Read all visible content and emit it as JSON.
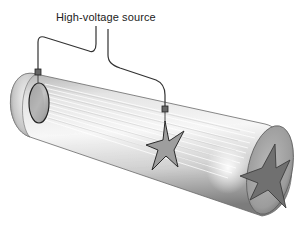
{
  "diagram": {
    "title": "High-voltage source",
    "components": {
      "source_label": "High-voltage source",
      "tube": "cathode-ray-tube",
      "cathode": "disc-electrode",
      "anode": "star-shaped-electrode",
      "shadow": "star-shaped-shadow"
    },
    "colors": {
      "wire": "#333333",
      "tube_light": "#f2f2f2",
      "tube_mid": "#c8c8c8",
      "tube_dark": "#8a8a8a",
      "star": "#9a9a9a",
      "shadow_star": "#6e6e6e",
      "end_cap": "#a8a8a8"
    }
  }
}
